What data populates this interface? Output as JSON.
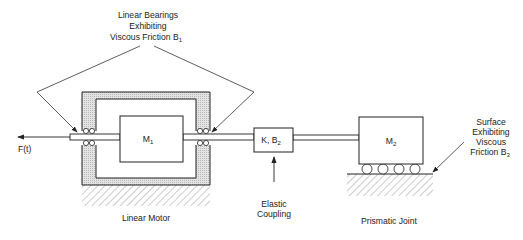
{
  "diagram": {
    "title_annotation": {
      "lines": [
        "Linear Bearings",
        "Exhibiting",
        "Viscous Friction B"
      ],
      "subscript": "1"
    },
    "force_label": "F(t)",
    "mass1": {
      "label": "M",
      "subscript": "1"
    },
    "mass2": {
      "label": "M",
      "subscript": "2"
    },
    "coupling_box": {
      "label": "K, B",
      "subscript": "2"
    },
    "coupling_caption": [
      "Elastic",
      "Coupling"
    ],
    "motor_caption": "Linear Motor",
    "joint_caption": "Prismatic Joint",
    "surface_annotation": {
      "lines": [
        "Surface",
        "Exhibiting",
        "Viscous",
        "Friction B"
      ],
      "subscript": "3"
    },
    "colors": {
      "line": "#222222",
      "housing_fill": "#d9d9d9",
      "hatch": "#888888"
    }
  }
}
